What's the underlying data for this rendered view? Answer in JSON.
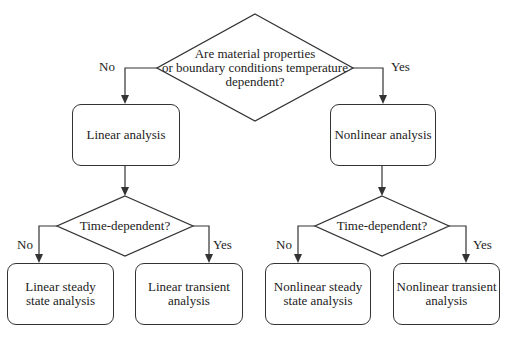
{
  "flowchart": {
    "root_decision": {
      "lines": [
        "Are material properties",
        "or boundary conditions temperature",
        "dependent?"
      ]
    },
    "branch_labels": {
      "root_no": "No",
      "root_yes": "Yes",
      "left_no": "No",
      "left_yes": "Yes",
      "right_no": "No",
      "right_yes": "Yes"
    },
    "process": {
      "linear": "Linear analysis",
      "nonlinear": "Nonlinear analysis"
    },
    "sub_decisions": {
      "left": "Time-dependent?",
      "right": "Time-dependent?"
    },
    "outcomes": {
      "linear_steady": [
        "Linear steady",
        "state analysis"
      ],
      "linear_transient": [
        "Linear transient",
        "analysis"
      ],
      "nonlinear_steady": [
        "Nonlinear steady",
        "state analysis"
      ],
      "nonlinear_transient": [
        "Nonlinear transient",
        "analysis"
      ]
    },
    "colors": {
      "line": "#333333",
      "background": "#ffffff",
      "text": "#222222"
    }
  }
}
